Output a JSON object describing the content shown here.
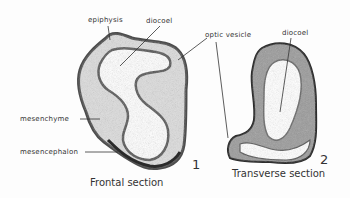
{
  "figure": {
    "section1": {
      "number": "1",
      "caption": "Frontal section",
      "labels": {
        "epiphysis": "epiphysis",
        "diocoel": "diocoel",
        "mesenchyme": "mesenchyme",
        "mesencephalon": "mesencephalon"
      }
    },
    "section2": {
      "number": "2",
      "caption": "Transverse section",
      "labels": {
        "diocoel": "diocoel"
      }
    },
    "shared_labels": {
      "optic_vesicle": "optic vesicle"
    }
  }
}
